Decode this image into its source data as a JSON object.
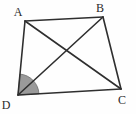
{
  "figure": {
    "kind": "geometry-diagram",
    "name": "quadrilateral-with-diagonals",
    "background_color": "#fefefe",
    "stroke_color": "#2f2f2f",
    "stroke_width": 1.6,
    "angle_fill_color": "#9a9a9a",
    "angle_stroke_color": "#6f6f6f",
    "label_color": "#2b2b2b",
    "label_font_size": 12
  },
  "vertices": [
    {
      "id": "A",
      "label": "A",
      "x": 25,
      "y": 21,
      "label_x": 18,
      "label_y": 16
    },
    {
      "id": "B",
      "label": "B",
      "x": 103,
      "y": 17,
      "label_x": 100,
      "label_y": 12
    },
    {
      "id": "C",
      "label": "C",
      "x": 121,
      "y": 89,
      "label_x": 122,
      "label_y": 104
    },
    {
      "id": "D",
      "label": "D",
      "x": 18,
      "y": 95,
      "label_x": 6,
      "label_y": 109
    }
  ],
  "sides": [
    {
      "id": "AB",
      "from": "A",
      "to": "B",
      "x1": 25,
      "y1": 21,
      "x2": 103,
      "y2": 17
    },
    {
      "id": "BC",
      "from": "B",
      "to": "C",
      "x1": 103,
      "y1": 17,
      "x2": 121,
      "y2": 89
    },
    {
      "id": "CD",
      "from": "C",
      "to": "D",
      "x1": 121,
      "y1": 89,
      "x2": 18,
      "y2": 95
    },
    {
      "id": "DA",
      "from": "D",
      "to": "A",
      "x1": 18,
      "y1": 95,
      "x2": 25,
      "y2": 21
    }
  ],
  "diagonals": [
    {
      "id": "AC",
      "from": "A",
      "to": "C",
      "x1": 25,
      "y1": 21,
      "x2": 121,
      "y2": 89
    },
    {
      "id": "BD",
      "from": "B",
      "to": "D",
      "x1": 103,
      "y1": 17,
      "x2": 18,
      "y2": 95
    }
  ],
  "angle_marks": [
    {
      "id": "angle-D",
      "at_vertex": "D",
      "between_rays": [
        "DC",
        "DA"
      ],
      "center_x": 18,
      "center_y": 95,
      "radius": 21,
      "start_angle_deg": -3.3,
      "end_angle_deg": -84.6,
      "shaded": true
    }
  ],
  "chart_data": {
    "type": "scatter",
    "title": "",
    "xlabel": "",
    "ylabel": "",
    "x": [
      25,
      103,
      121,
      18
    ],
    "y": [
      21,
      17,
      89,
      95
    ],
    "point_labels": [
      "A",
      "B",
      "C",
      "D"
    ],
    "xlim": [
      0,
      136
    ],
    "ylim": [
      0,
      114
    ],
    "grid": false,
    "legend": null
  }
}
